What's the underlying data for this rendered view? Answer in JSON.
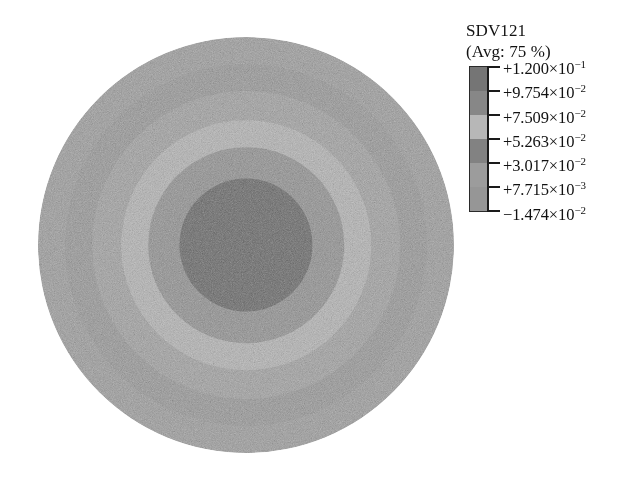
{
  "legend": {
    "title": "SDV121",
    "subtitle": "(Avg: 75 %)",
    "entries": [
      {
        "sign": "+",
        "mantissa": "1.200",
        "times": "×",
        "base": "10",
        "exponent": "−1",
        "text": "+1.200×10⁻¹",
        "value": 0.12,
        "swatch": "#7c7c7c"
      },
      {
        "sign": "+",
        "mantissa": "9.754",
        "times": "×",
        "base": "10",
        "exponent": "−2",
        "text": "+9.754×10⁻²",
        "value": 0.09754,
        "swatch": "#8f8f8f"
      },
      {
        "sign": "+",
        "mantissa": "7.509",
        "times": "×",
        "base": "10",
        "exponent": "−2",
        "text": "+7.509×10⁻²",
        "value": 0.07509,
        "swatch": "#c3c3c3"
      },
      {
        "sign": "+",
        "mantissa": "5.263",
        "times": "×",
        "base": "10",
        "exponent": "−2",
        "text": "+5.263×10⁻²",
        "value": 0.05263,
        "swatch": "#8a8a8a"
      },
      {
        "sign": "+",
        "mantissa": "3.017",
        "times": "×",
        "base": "10",
        "exponent": "−2",
        "text": "+3.017×10⁻²",
        "value": 0.03017,
        "swatch": "#a6a6a6"
      },
      {
        "sign": "+",
        "mantissa": "7.715",
        "times": "×",
        "base": "10",
        "exponent": "−3",
        "text": "+7.715×10⁻³",
        "value": 0.007715,
        "swatch": "#a0a0a0"
      },
      {
        "sign": "−",
        "mantissa": "1.474",
        "times": "×",
        "base": "10",
        "exponent": "−2",
        "text": "−1.474×10⁻²",
        "value": -0.01474,
        "swatch": "#5a5a5a"
      }
    ]
  },
  "chart_data": {
    "type": "heatmap",
    "title": "SDV121",
    "subtitle": "(Avg: 75 %)",
    "variable": "SDV121",
    "average_percent": "75 %",
    "geometry": "circular-disk",
    "field_pattern": "axisymmetric concentric contour bands, minimum at center",
    "legend_position": "right",
    "grid": false,
    "xlabel": "",
    "ylabel": "",
    "contour_levels": [
      0.12,
      0.09754,
      0.07509,
      0.05263,
      0.03017,
      0.007715,
      -0.01474
    ],
    "level_labels": [
      "+1.200×10⁻¹",
      "+9.754×10⁻²",
      "+7.509×10⁻²",
      "+5.263×10⁻²",
      "+3.017×10⁻²",
      "+7.715×10⁻³",
      "−1.474×10⁻²"
    ],
    "value_range": [
      -0.01474,
      0.12
    ],
    "colormap": "grayscale-banded",
    "bands": [
      {
        "index": 0,
        "name": "core",
        "radius_fraction": 0.32,
        "color": "#6e6e6e",
        "level_range": [
          -0.01474,
          0.007715
        ]
      },
      {
        "index": 1,
        "name": "ring-1",
        "radius_fraction": 0.47,
        "color": "#949494",
        "level_range": [
          0.007715,
          0.03017
        ]
      },
      {
        "index": 2,
        "name": "ring-2",
        "radius_fraction": 0.6,
        "color": "#b4b4b4",
        "level_range": [
          0.03017,
          0.05263
        ]
      },
      {
        "index": 3,
        "name": "ring-3",
        "radius_fraction": 0.74,
        "color": "#a3a3a3",
        "level_range": [
          0.05263,
          0.07509
        ]
      },
      {
        "index": 4,
        "name": "ring-4",
        "radius_fraction": 0.87,
        "color": "#9a9a9a",
        "level_range": [
          0.07509,
          0.09754
        ]
      },
      {
        "index": 5,
        "name": "ring-outer",
        "radius_fraction": 1.0,
        "color": "#9f9f9f",
        "level_range": [
          0.09754,
          0.12
        ]
      }
    ]
  }
}
